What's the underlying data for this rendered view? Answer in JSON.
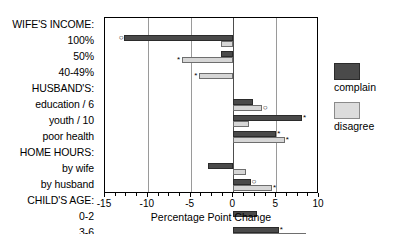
{
  "chart_data": {
    "type": "bar",
    "orientation": "horizontal",
    "title": "",
    "xlabel": "Percentage Point Change",
    "ylabel": "",
    "xlim": [
      -15,
      10
    ],
    "xticks": [
      -15,
      -10,
      -5,
      0,
      5,
      10
    ],
    "xticklabels": [
      "-15",
      "-10",
      "-5",
      "0",
      "5",
      "10"
    ],
    "minor_xticks": [
      -13.75,
      -12.5,
      -11.25,
      -8.75,
      -7.5,
      -6.25,
      -3.75,
      -2.5,
      -1.25,
      1.25,
      2.5,
      3.75,
      6.25,
      7.5,
      8.75
    ],
    "grid": "vertical gridlines at -10, -5, 0, 5",
    "gridlines": [
      -10,
      -5,
      0,
      5
    ],
    "legend_position": "right",
    "categories": [
      "WIFE'S INCOME:",
      "100%",
      "50%",
      "40-49%",
      "HUSBAND'S:",
      "education / 6",
      "youth / 10",
      "poor health",
      "HOME HOURS:",
      "by wife",
      "by husband",
      "CHILD'S AGE:",
      "0-2",
      "3-6",
      "7-12"
    ],
    "group_headers": [
      "WIFE'S INCOME:",
      "HUSBAND'S:",
      "HOME HOURS:",
      "CHILD'S AGE:"
    ],
    "series": [
      {
        "name": "complain",
        "color": "#4a4a4a",
        "values": [
          null,
          -12.8,
          -1.5,
          0,
          null,
          2.3,
          8.0,
          5.0,
          null,
          -3.0,
          2.0,
          null,
          2.8,
          5.3,
          2.0
        ]
      },
      {
        "name": "disagree",
        "color": "#d6d6d6",
        "values": [
          null,
          -1.5,
          -6.0,
          -4.0,
          null,
          3.3,
          1.8,
          6.0,
          null,
          1.5,
          4.5,
          null,
          0,
          8.5,
          4.8
        ]
      }
    ],
    "significance_markers": [
      {
        "category": "100%",
        "series": "complain",
        "marker": "circle",
        "value": -12.8
      },
      {
        "category": "50%",
        "series": "disagree",
        "marker": "star",
        "value": -6.0
      },
      {
        "category": "40-49%",
        "series": "disagree",
        "marker": "star",
        "value": -4.0
      },
      {
        "category": "education / 6",
        "series": "disagree",
        "marker": "circle",
        "value": 3.3
      },
      {
        "category": "youth / 10",
        "series": "complain",
        "marker": "star",
        "value": 8.0
      },
      {
        "category": "poor health",
        "series": "complain",
        "marker": "star",
        "value": 5.0
      },
      {
        "category": "poor health",
        "series": "disagree",
        "marker": "star",
        "value": 6.0
      },
      {
        "category": "by husband",
        "series": "complain",
        "marker": "circle",
        "value": 2.0
      },
      {
        "category": "by husband",
        "series": "disagree",
        "marker": "star",
        "value": 4.5
      },
      {
        "category": "3-6",
        "series": "complain",
        "marker": "star",
        "value": 5.3
      },
      {
        "category": "7-12",
        "series": "disagree",
        "marker": "star",
        "value": 4.8
      }
    ]
  },
  "legend": {
    "entries": [
      {
        "label": "complain",
        "color": "#4a4a4a"
      },
      {
        "label": "disagree",
        "color": "#d6d6d6"
      }
    ]
  },
  "axis": {
    "x_title": "Percentage Point Change"
  }
}
